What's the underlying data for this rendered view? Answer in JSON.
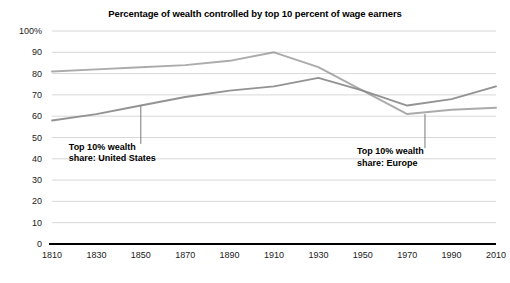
{
  "chart_data": {
    "type": "line",
    "title": "Percentage of wealth controlled by top 10 percent of wage earners",
    "xlabel": "",
    "ylabel": "",
    "xlim": [
      1810,
      2010
    ],
    "ylim": [
      0,
      100
    ],
    "grid": true,
    "legend_position": "inline-annotations",
    "x_ticks": [
      "1810",
      "1830",
      "1850",
      "1870",
      "1890",
      "1910",
      "1930",
      "1950",
      "1970",
      "1990",
      "2010"
    ],
    "y_ticks": [
      "100%",
      "90",
      "80",
      "70",
      "60",
      "50",
      "40",
      "30",
      "20",
      "10",
      "0"
    ],
    "x": [
      1810,
      1830,
      1850,
      1870,
      1890,
      1910,
      1930,
      1950,
      1970,
      1990,
      2010
    ],
    "series": [
      {
        "name": "Top 10% wealth share: Europe",
        "color": "#8a8a8a",
        "values": [
          81,
          82,
          83,
          84,
          86,
          90,
          83,
          72,
          61,
          63,
          64
        ]
      },
      {
        "name": "Top 10% wealth share: United States",
        "color": "#8a8a8a",
        "values": [
          58,
          61,
          65,
          69,
          72,
          74,
          78,
          72,
          65,
          68,
          74
        ]
      }
    ],
    "annotations": [
      {
        "label": "Top 10% wealth\nshare: United States",
        "x": 1850,
        "y": 65,
        "leader_to_y": 47
      },
      {
        "label": "Top 10% wealth\nshare: Europe",
        "x": 1978,
        "y": 61,
        "leader_to_y": 45
      }
    ]
  },
  "axis": {
    "y_labels": [
      "100%",
      "90",
      "80",
      "70",
      "60",
      "50",
      "40",
      "30",
      "20",
      "10",
      "0"
    ],
    "x_labels": [
      "1810",
      "1830",
      "1850",
      "1870",
      "1890",
      "1910",
      "1930",
      "1950",
      "1970",
      "1990",
      "2010"
    ]
  },
  "annotations": {
    "us_line1": "Top 10% wealth",
    "us_line2": "share: United States",
    "eu_line1": "Top 10% wealth",
    "eu_line2": "share: Europe"
  },
  "colors": {
    "line": "#8a8a8a",
    "grid": "#d8d8d8",
    "axis": "#000000",
    "text": "#222222"
  }
}
